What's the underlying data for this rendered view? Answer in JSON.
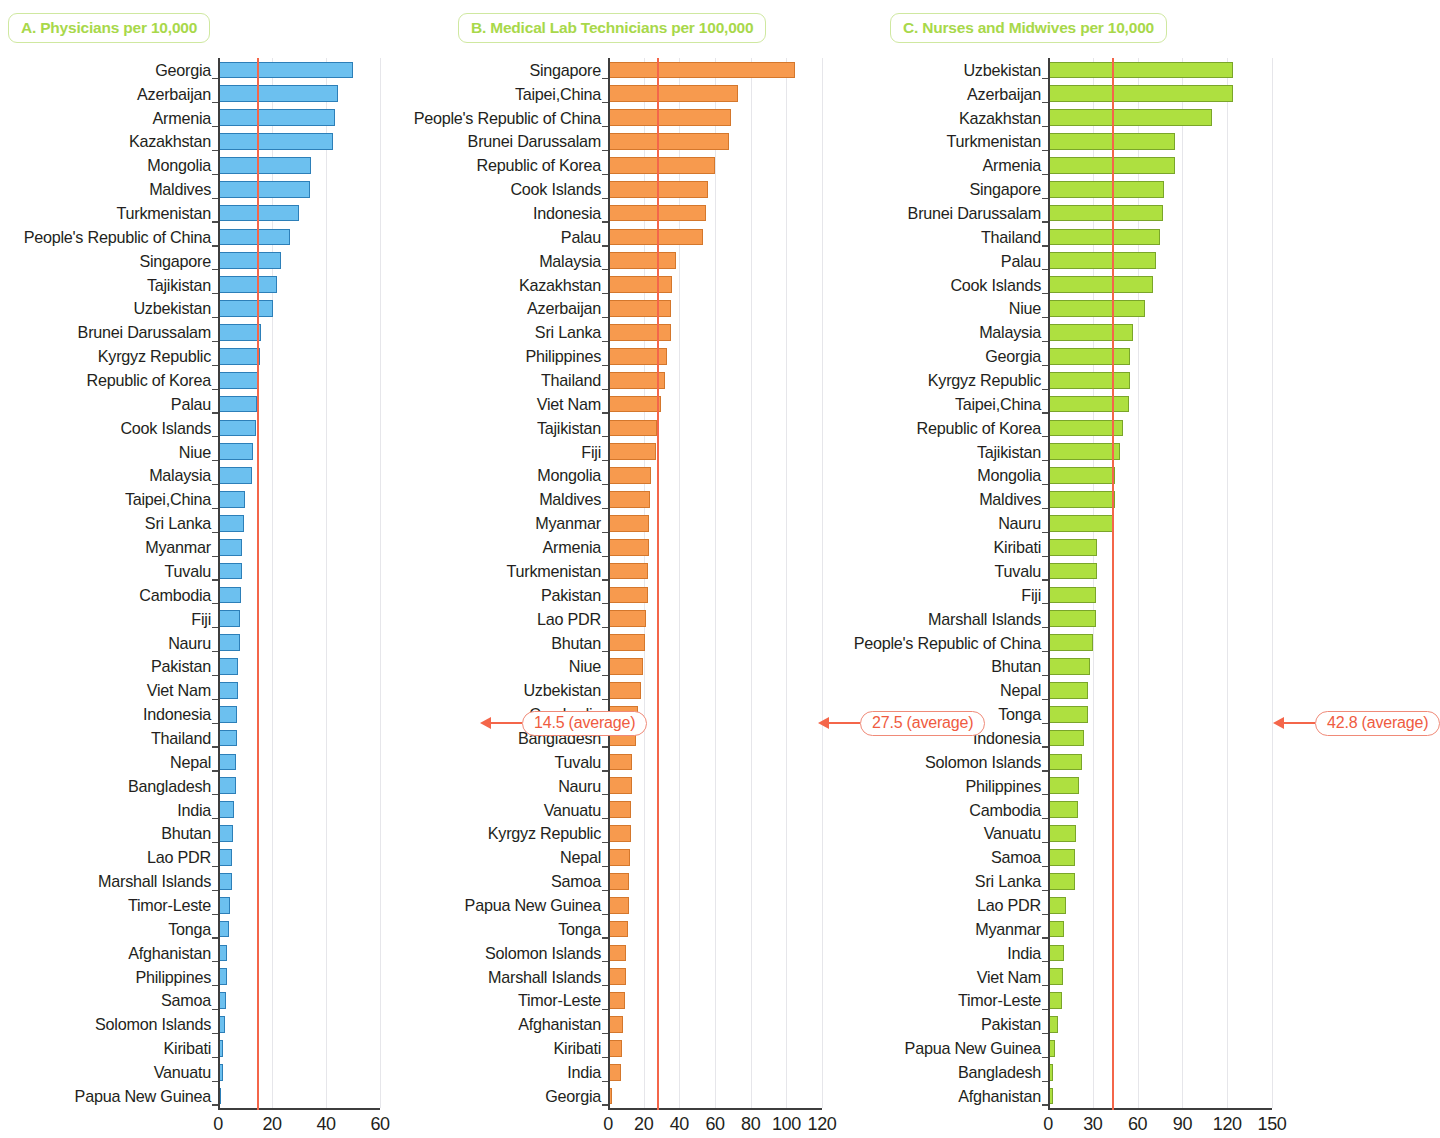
{
  "figure": {
    "panels": [
      {
        "id": "A",
        "title": "A. Physicians per 10,000",
        "color": "#6cc0ef",
        "average_label": "14.5 (average)",
        "average_value": 14.5,
        "xticks": [
          "0",
          "20",
          "40",
          "60"
        ]
      },
      {
        "id": "B",
        "title": "B. Medical Lab Technicians per 100,000",
        "color": "#f79a4e",
        "average_label": "27.5 (average)",
        "average_value": 27.5,
        "xticks": [
          "0",
          "20",
          "40",
          "60",
          "80",
          "100",
          "120"
        ]
      },
      {
        "id": "C",
        "title": "C. Nurses and Midwives per 10,000",
        "color": "#aee040",
        "average_label": "42.8 (average)",
        "average_value": 42.8,
        "xticks": [
          "0",
          "30",
          "60",
          "90",
          "120",
          "150"
        ]
      }
    ],
    "average_line_color": "#f4664a",
    "title_color": "#a8d84a"
  },
  "chart_data": [
    {
      "type": "bar",
      "orientation": "horizontal",
      "title": "A. Physicians per 10,000",
      "xlabel": "",
      "ylabel": "",
      "xlim": [
        0,
        60
      ],
      "xticks": [
        0,
        20,
        40,
        60
      ],
      "grid": true,
      "legend": "none",
      "annotations": [
        {
          "text": "14.5 (average)",
          "value": 14.5,
          "type": "reference-line"
        }
      ],
      "categories": [
        "Georgia",
        "Azerbaijan",
        "Armenia",
        "Kazakhstan",
        "Mongolia",
        "Maldives",
        "Turkmenistan",
        "People's Republic of China",
        "Singapore",
        "Tajikistan",
        "Uzbekistan",
        "Brunei Darussalam",
        "Kyrgyz Republic",
        "Republic of Korea",
        "Palau",
        "Cook Islands",
        "Niue",
        "Malaysia",
        "Taipei,China",
        "Sri Lanka",
        "Myanmar",
        "Tuvalu",
        "Cambodia",
        "Fiji",
        "Nauru",
        "Pakistan",
        "Viet Nam",
        "Indonesia",
        "Thailand",
        "Nepal",
        "Bangladesh",
        "India",
        "Bhutan",
        "Lao PDR",
        "Marshall Islands",
        "Timor-Leste",
        "Tonga",
        "Afghanistan",
        "Philippines",
        "Samoa",
        "Solomon Islands",
        "Kiribati",
        "Vanuatu",
        "Papua New Guinea"
      ],
      "values": [
        50.0,
        44.5,
        43.5,
        42.5,
        34.5,
        34.0,
        30.0,
        26.5,
        23.5,
        22.0,
        20.5,
        16.0,
        15.5,
        15.0,
        14.5,
        14.0,
        13.0,
        12.5,
        10.0,
        9.5,
        9.0,
        9.0,
        8.5,
        8.0,
        8.0,
        7.5,
        7.5,
        7.0,
        7.0,
        6.5,
        6.5,
        6.0,
        5.5,
        5.0,
        5.0,
        4.5,
        4.0,
        3.5,
        3.5,
        3.0,
        2.5,
        2.0,
        1.8,
        1.2
      ]
    },
    {
      "type": "bar",
      "orientation": "horizontal",
      "title": "B. Medical Lab Technicians per 100,000",
      "xlabel": "",
      "ylabel": "",
      "xlim": [
        0,
        120
      ],
      "xticks": [
        0,
        20,
        40,
        60,
        80,
        100,
        120
      ],
      "grid": true,
      "legend": "none",
      "annotations": [
        {
          "text": "27.5 (average)",
          "value": 27.5,
          "type": "reference-line"
        }
      ],
      "categories": [
        "Singapore",
        "Taipei,China",
        "People's Republic of China",
        "Brunei Darussalam",
        "Republic of Korea",
        "Cook Islands",
        "Indonesia",
        "Palau",
        "Malaysia",
        "Kazakhstan",
        "Azerbaijan",
        "Sri Lanka",
        "Philippines",
        "Thailand",
        "Viet Nam",
        "Tajikistan",
        "Fiji",
        "Mongolia",
        "Maldives",
        "Myanmar",
        "Armenia",
        "Turkmenistan",
        "Pakistan",
        "Lao PDR",
        "Bhutan",
        "Niue",
        "Uzbekistan",
        "Cambodia",
        "Bangladesh",
        "Tuvalu",
        "Nauru",
        "Vanuatu",
        "Kyrgyz Republic",
        "Nepal",
        "Samoa",
        "Papua New Guinea",
        "Tonga",
        "Solomon Islands",
        "Marshall Islands",
        "Timor-Leste",
        "Afghanistan",
        "Kiribati",
        "India",
        "Georgia"
      ],
      "values": [
        105.0,
        73.0,
        69.0,
        68.0,
        60.0,
        56.0,
        55.0,
        53.0,
        38.0,
        36.0,
        35.5,
        35.5,
        33.0,
        32.0,
        29.5,
        27.5,
        27.0,
        24.0,
        23.5,
        23.0,
        23.0,
        22.5,
        22.5,
        21.5,
        21.0,
        19.5,
        18.5,
        17.0,
        15.5,
        13.5,
        13.5,
        13.0,
        13.0,
        12.5,
        12.0,
        11.5,
        11.0,
        10.0,
        10.0,
        9.5,
        8.5,
        8.0,
        7.5,
        2.5
      ]
    },
    {
      "type": "bar",
      "orientation": "horizontal",
      "title": "C. Nurses and Midwives per 10,000",
      "xlabel": "",
      "ylabel": "",
      "xlim": [
        0,
        150
      ],
      "xticks": [
        0,
        30,
        60,
        90,
        120,
        150
      ],
      "grid": true,
      "legend": "none",
      "annotations": [
        {
          "text": "42.8 (average)",
          "value": 42.8,
          "type": "reference-line"
        }
      ],
      "categories": [
        "Uzbekistan",
        "Azerbaijan",
        "Kazakhstan",
        "Turkmenistan",
        "Armenia",
        "Singapore",
        "Brunei Darussalam",
        "Thailand",
        "Palau",
        "Cook Islands",
        "Niue",
        "Malaysia",
        "Georgia",
        "Kyrgyz Republic",
        "Taipei,China",
        "Republic of Korea",
        "Tajikistan",
        "Mongolia",
        "Maldives",
        "Nauru",
        "Kiribati",
        "Tuvalu",
        "Fiji",
        "Marshall Islands",
        "People's Republic of China",
        "Bhutan",
        "Nepal",
        "Tonga",
        "Indonesia",
        "Solomon Islands",
        "Philippines",
        "Cambodia",
        "Vanuatu",
        "Samoa",
        "Sri Lanka",
        "Lao PDR",
        "Myanmar",
        "India",
        "Viet Nam",
        "Timor-Leste",
        "Pakistan",
        "Papua New Guinea",
        "Bangladesh",
        "Afghanistan"
      ],
      "values": [
        124.0,
        124.0,
        110.0,
        85.0,
        85.0,
        78.0,
        77.0,
        75.0,
        72.0,
        70.0,
        65.0,
        57.0,
        55.0,
        55.0,
        54.0,
        50.0,
        48.0,
        45.0,
        45.0,
        44.0,
        33.0,
        33.0,
        32.0,
        32.0,
        30.0,
        28.0,
        27.0,
        27.0,
        24.0,
        23.0,
        21.0,
        20.0,
        19.0,
        18.0,
        18.0,
        12.0,
        11.0,
        11.0,
        10.0,
        9.5,
        7.0,
        4.5,
        3.5,
        3.5
      ]
    }
  ]
}
